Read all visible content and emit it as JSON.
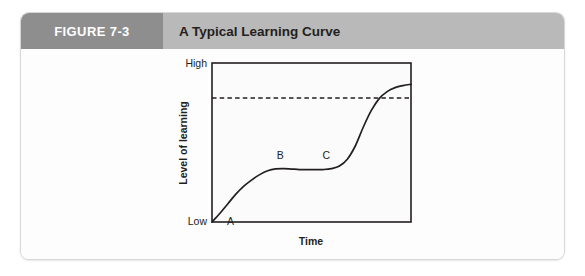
{
  "figure": {
    "number_label": "FIGURE 7-3",
    "title": "A Typical Learning Curve",
    "number_box_color": "#8e8e8e",
    "title_bar_color": "#b9b9b9",
    "card_border_color": "#d8d8d8"
  },
  "chart_data": {
    "type": "line",
    "title": "A Typical Learning Curve",
    "xlabel": "Time",
    "ylabel": "Level of learning",
    "grid": false,
    "legend": null,
    "axis_color": "#231f20",
    "curve_color": "#231f20",
    "x_tick_labels": [],
    "y_tick_labels": [
      "High",
      "Low"
    ],
    "ylim": [
      0,
      1
    ],
    "xlim": [
      0,
      1
    ],
    "reference_line": {
      "style": "dashed",
      "orientation": "horizontal",
      "y": 0.78,
      "color": "#231f20"
    },
    "annotations": [
      {
        "label": "A",
        "x": 0.045,
        "y": 0.055
      },
      {
        "label": "B",
        "x": 0.335,
        "y": 0.365
      },
      {
        "label": "C",
        "x": 0.565,
        "y": 0.365
      }
    ],
    "series": [
      {
        "name": "Learning curve",
        "x": [
          0.0,
          0.04,
          0.08,
          0.12,
          0.16,
          0.2,
          0.24,
          0.28,
          0.32,
          0.36,
          0.4,
          0.44,
          0.48,
          0.52,
          0.56,
          0.6,
          0.64,
          0.68,
          0.72,
          0.76,
          0.8,
          0.84,
          0.88,
          0.92,
          0.96,
          1.0
        ],
        "y": [
          0.0,
          0.055,
          0.115,
          0.175,
          0.225,
          0.265,
          0.298,
          0.322,
          0.334,
          0.336,
          0.333,
          0.33,
          0.329,
          0.329,
          0.33,
          0.336,
          0.352,
          0.395,
          0.478,
          0.596,
          0.7,
          0.776,
          0.82,
          0.845,
          0.858,
          0.866
        ]
      }
    ]
  }
}
